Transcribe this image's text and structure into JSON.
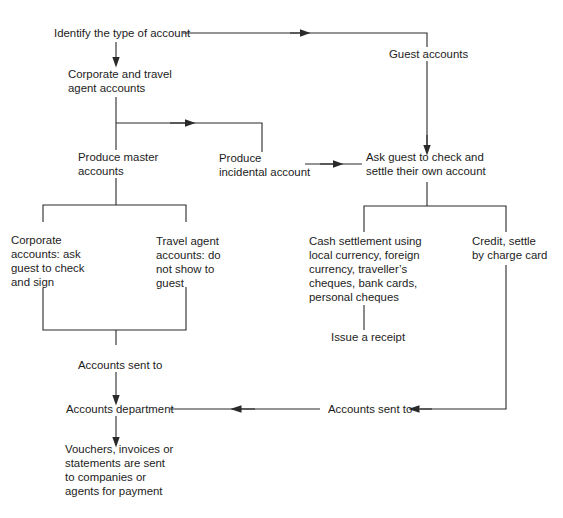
{
  "diagram": {
    "colors": {
      "line": "#2a2a2a",
      "text": "#1c1c1c",
      "background": "#ffffff"
    },
    "nodes": {
      "identify": {
        "lines": [
          "Identify the type of account"
        ]
      },
      "guest_accounts": {
        "lines": [
          "Guest accounts"
        ]
      },
      "corporate_travel": {
        "lines": [
          "Corporate and travel",
          "agent accounts"
        ]
      },
      "produce_master": {
        "lines": [
          "Produce master",
          "accounts"
        ]
      },
      "produce_incidental": {
        "lines": [
          "Produce",
          "incidental account"
        ]
      },
      "ask_guest": {
        "lines": [
          "Ask guest to check and",
          "settle their own account"
        ]
      },
      "corporate_accounts": {
        "lines": [
          "Corporate",
          "accounts: ask",
          "guest to check",
          "and sign"
        ]
      },
      "travel_agent_accounts": {
        "lines": [
          "Travel agent",
          "accounts: do",
          "not show to",
          "guest"
        ]
      },
      "cash_settlement": {
        "lines": [
          "Cash settlement using",
          "local currency, foreign",
          "currency, traveller’s",
          "cheques, bank cards,",
          "personal cheques"
        ]
      },
      "credit_settle": {
        "lines": [
          "Credit, settle",
          "by charge card"
        ]
      },
      "issue_receipt": {
        "lines": [
          "Issue a receipt"
        ]
      },
      "accounts_sent_to_left": {
        "lines": [
          "Accounts sent to"
        ]
      },
      "accounts_sent_to_right": {
        "lines": [
          "Accounts sent to"
        ]
      },
      "accounts_department": {
        "lines": [
          "Accounts department"
        ]
      },
      "vouchers": {
        "lines": [
          "Vouchers, invoices or",
          "statements are sent",
          "to companies or",
          "agents for payment"
        ]
      }
    },
    "edges": [
      {
        "from": "identify",
        "to": "corporate_travel"
      },
      {
        "from": "identify",
        "to": "guest_accounts"
      },
      {
        "from": "guest_accounts",
        "to": "ask_guest"
      },
      {
        "from": "corporate_travel",
        "to": "produce_master"
      },
      {
        "from": "corporate_travel",
        "to": "produce_incidental"
      },
      {
        "from": "produce_incidental",
        "to": "ask_guest"
      },
      {
        "from": "produce_master",
        "to": "corporate_accounts"
      },
      {
        "from": "produce_master",
        "to": "travel_agent_accounts"
      },
      {
        "from": "corporate_accounts",
        "to": "accounts_sent_to_left"
      },
      {
        "from": "travel_agent_accounts",
        "to": "accounts_sent_to_left"
      },
      {
        "from": "accounts_sent_to_left",
        "to": "accounts_department"
      },
      {
        "from": "accounts_department",
        "to": "vouchers"
      },
      {
        "from": "ask_guest",
        "to": "cash_settlement"
      },
      {
        "from": "ask_guest",
        "to": "credit_settle"
      },
      {
        "from": "cash_settlement",
        "to": "issue_receipt"
      },
      {
        "from": "credit_settle",
        "to": "accounts_sent_to_right"
      },
      {
        "from": "accounts_sent_to_right",
        "to": "accounts_department"
      }
    ]
  }
}
